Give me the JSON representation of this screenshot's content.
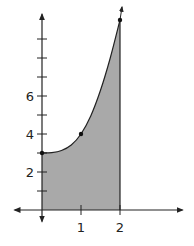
{
  "chart_data": {
    "type": "area",
    "title": "",
    "xlabel": "",
    "ylabel": "",
    "xlim": [
      -0.75,
      3.6
    ],
    "ylim": [
      -0.6,
      10.3
    ],
    "x_ticks": [
      1,
      2
    ],
    "x_tick_labels": [
      "1",
      "2"
    ],
    "y_ticks": [
      1,
      2,
      3,
      4,
      5,
      6,
      7,
      8,
      9
    ],
    "y_tick_labels": [
      "",
      "2",
      "",
      "4",
      "",
      "6",
      "",
      "",
      ""
    ],
    "curve": {
      "x": [
        0,
        0.25,
        0.5,
        0.75,
        1,
        1.25,
        1.5,
        1.75,
        2
      ],
      "y": [
        3,
        3.02,
        3.13,
        3.42,
        4,
        4.95,
        6.3,
        8.0,
        10
      ]
    },
    "marked_points": [
      {
        "x": 0,
        "y": 3
      },
      {
        "x": 1,
        "y": 4
      },
      {
        "x": 2,
        "y": 10
      }
    ],
    "shaded_region": {
      "from_x": 0,
      "to_x": 2,
      "description": "area under curve between x=0 and x=2"
    },
    "grid": false,
    "legend": null
  },
  "colors": {
    "fill": "#a9a9a9",
    "stroke": "#222222",
    "background": "#ffffff"
  },
  "layout": {
    "origin_px": [
      42,
      210
    ],
    "x_unit_px": 39,
    "y_unit_px": 19
  }
}
